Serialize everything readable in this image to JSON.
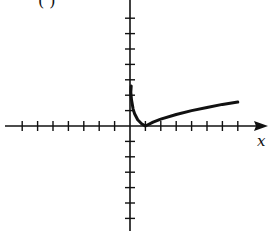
{
  "chart_data": {
    "type": "line",
    "title": "",
    "panel_label": "( )",
    "xlabel": "x",
    "ylabel": "",
    "xlim": [
      -7.3,
      8.8
    ],
    "ylim": [
      -6.7,
      8.2
    ],
    "tick_spacing": 1,
    "x_ticks": [
      -7,
      -6,
      -5,
      -4,
      -3,
      -2,
      -1,
      1,
      2,
      3,
      4,
      5,
      6,
      7
    ],
    "y_ticks": [
      -6,
      -5,
      -4,
      -3,
      -2,
      -1,
      1,
      2,
      3,
      4,
      5,
      6,
      7
    ],
    "tick_labels_shown": false,
    "grid": false,
    "legend": null,
    "series": [
      {
        "name": "f(x)",
        "description": "curve resembling |ln x|: descends steeply from near the y-axis, touches x-axis at x=1, then rises slowly",
        "points": [
          [
            0.05,
            2.2
          ],
          [
            0.1,
            1.7
          ],
          [
            0.2,
            1.1
          ],
          [
            0.3,
            0.8
          ],
          [
            0.5,
            0.4
          ],
          [
            0.75,
            0.15
          ],
          [
            1,
            0
          ],
          [
            1.5,
            0.25
          ],
          [
            2,
            0.45
          ],
          [
            3,
            0.75
          ],
          [
            4,
            1.0
          ],
          [
            5,
            1.2
          ],
          [
            6,
            1.4
          ],
          [
            7,
            1.55
          ]
        ]
      }
    ]
  },
  "labels": {
    "panel": "( )",
    "x_axis": "x"
  }
}
